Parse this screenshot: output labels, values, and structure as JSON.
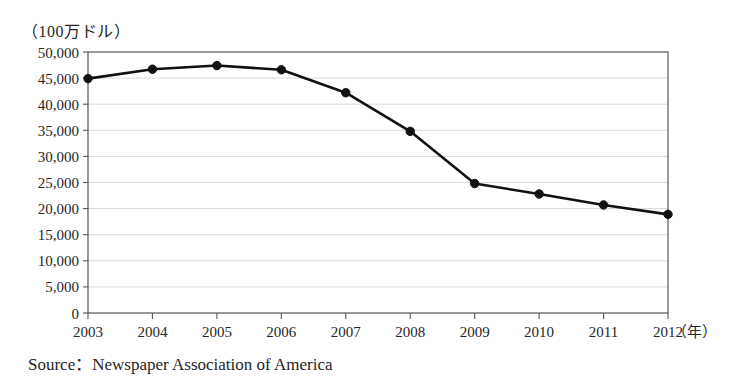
{
  "figure": {
    "unit_label": "（100万ドル）",
    "source_caption": "Source：Newspaper Association of America",
    "x_axis_unit": "（年）"
  },
  "chart_data": {
    "type": "line",
    "title": "",
    "subtitle": "",
    "xlabel": "（年）",
    "ylabel": "（100万ドル）",
    "categories": [
      "2003",
      "2004",
      "2005",
      "2006",
      "2007",
      "2008",
      "2009",
      "2010",
      "2011",
      "2012"
    ],
    "values": [
      44900,
      46700,
      47400,
      46600,
      42200,
      34800,
      24800,
      22800,
      20700,
      18900
    ],
    "series": [
      {
        "name": "Newspaper advertising revenue",
        "values": [
          44900,
          46700,
          47400,
          46600,
          42200,
          34800,
          24800,
          22800,
          20700,
          18900
        ]
      }
    ],
    "ylim": [
      0,
      50000
    ],
    "y_ticks": [
      0,
      5000,
      10000,
      15000,
      20000,
      25000,
      30000,
      35000,
      40000,
      45000,
      50000
    ],
    "y_tick_labels": [
      "0",
      "5,000",
      "10,000",
      "15,000",
      "20,000",
      "25,000",
      "30,000",
      "35,000",
      "40,000",
      "45,000",
      "50,000"
    ],
    "x_tick_labels": [
      "2003",
      "2004",
      "2005",
      "2006",
      "2007",
      "2008",
      "2009",
      "2010",
      "2011",
      "2012"
    ],
    "grid": true,
    "legend": false,
    "marker": "circle",
    "line_color": "#111111",
    "marker_color": "#111111",
    "grid_color": "#c8c8c8",
    "axis_color": "#555555"
  }
}
